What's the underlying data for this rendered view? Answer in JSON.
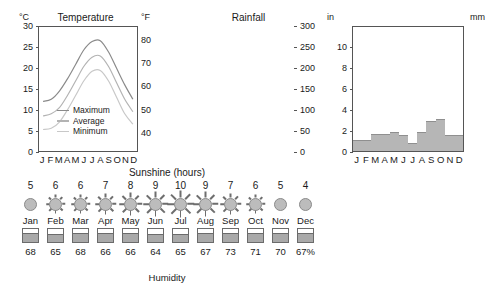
{
  "chart_data": [
    {
      "type": "line",
      "title": "Temperature",
      "left_unit": "°C",
      "right_unit": "°F",
      "categories": [
        "J",
        "F",
        "M",
        "A",
        "M",
        "J",
        "J",
        "A",
        "S",
        "O",
        "N",
        "D"
      ],
      "months_full": [
        "Jan",
        "Feb",
        "Mar",
        "Apr",
        "May",
        "Jun",
        "Jul",
        "Aug",
        "Sep",
        "Oct",
        "Nov",
        "Dec"
      ],
      "ylim": [
        0,
        30
      ],
      "yticks": [
        0,
        5,
        10,
        15,
        20,
        25,
        30
      ],
      "y2lim": [
        32,
        86
      ],
      "y2ticks": [
        40,
        50,
        60,
        70,
        80
      ],
      "grid": false,
      "legend_position": "inside-lower-left",
      "series": [
        {
          "name": "Maximum",
          "color": "#8a8a8a",
          "values": [
            12.0,
            12.5,
            14.5,
            17.5,
            21.0,
            24.5,
            26.5,
            26.7,
            24.0,
            20.0,
            16.0,
            12.5
          ]
        },
        {
          "name": "Average",
          "color": "#b3b3b3",
          "values": [
            8.5,
            9.0,
            10.5,
            13.5,
            17.0,
            20.5,
            22.7,
            23.0,
            20.5,
            16.5,
            12.5,
            9.5
          ]
        },
        {
          "name": "Minimum",
          "color": "#c8c8c8",
          "values": [
            5.2,
            5.5,
            7.0,
            10.0,
            13.5,
            17.0,
            19.3,
            19.5,
            17.0,
            13.0,
            9.0,
            6.5
          ]
        }
      ]
    },
    {
      "type": "bar",
      "title": "Rainfall",
      "left_unit": "in",
      "right_unit": "mm",
      "categories": [
        "J",
        "F",
        "M",
        "A",
        "M",
        "J",
        "J",
        "A",
        "S",
        "O",
        "N",
        "D"
      ],
      "months_full": [
        "Jan",
        "Feb",
        "Mar",
        "Apr",
        "May",
        "Jun",
        "Jul",
        "Aug",
        "Sep",
        "Oct",
        "Nov",
        "Dec"
      ],
      "ylim": [
        0,
        12
      ],
      "yticks": [
        0,
        2,
        4,
        6,
        8,
        10
      ],
      "y2lim": [
        0,
        300
      ],
      "y2ticks": [
        0,
        50,
        100,
        150,
        200,
        250,
        300
      ],
      "grid": false,
      "values_mm": [
        27,
        27,
        42,
        42,
        45,
        38,
        20,
        45,
        72,
        78,
        38,
        38
      ],
      "ylabel": "in",
      "bar_color": "#b6b6b6"
    }
  ],
  "sunshine": {
    "title": "Sunshine (hours)",
    "values": [
      5,
      6,
      6,
      7,
      8,
      9,
      10,
      9,
      7,
      6,
      5,
      4
    ],
    "months": [
      "Jan",
      "Feb",
      "Mar",
      "Apr",
      "May",
      "Jun",
      "Jul",
      "Aug",
      "Sep",
      "Oct",
      "Nov",
      "Dec"
    ]
  },
  "humidity": {
    "title": "Humidity",
    "values": [
      "68",
      "65",
      "68",
      "66",
      "66",
      "64",
      "65",
      "67",
      "73",
      "71",
      "70",
      "67%"
    ],
    "percents": [
      68,
      65,
      68,
      66,
      66,
      64,
      65,
      67,
      73,
      71,
      70,
      67
    ]
  }
}
